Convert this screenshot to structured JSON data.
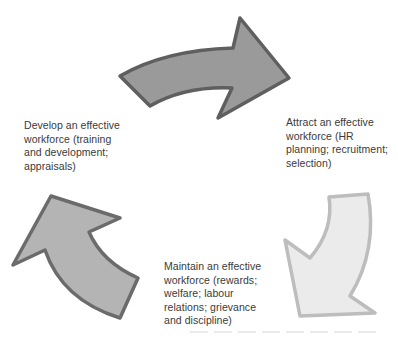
{
  "diagram": {
    "type": "cycle",
    "stages": [
      {
        "id": "develop",
        "label": "Develop an effective\nworkforce (training\nand development;\nappraisals)"
      },
      {
        "id": "attract",
        "label": "Attract an effective\nworkforce (HR\nplanning; recruitment;\nselection)"
      },
      {
        "id": "maintain",
        "label": "Maintain an effective\nworkforce (rewards;\nwelfare; labour\nrelations; grievance\nand discipline)"
      }
    ],
    "arrows": [
      {
        "id": "develop-to-attract",
        "direction": "right",
        "fill": "#9a9a9a",
        "stroke": "#5f5f5f"
      },
      {
        "id": "attract-to-maintain",
        "direction": "down-left",
        "fill": "#ebebeb",
        "stroke": "#bdbdbd"
      },
      {
        "id": "maintain-to-develop",
        "direction": "up-left",
        "fill": "#b4b4b4",
        "stroke": "#6b6b6b"
      }
    ]
  }
}
